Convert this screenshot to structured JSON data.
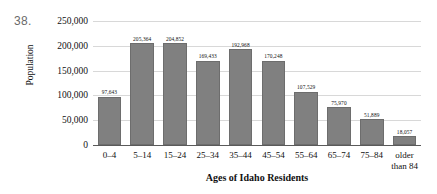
{
  "question_number": "38.",
  "chart_data": {
    "type": "bar",
    "title": "",
    "xlabel": "Ages of Idaho Residents",
    "ylabel": "Population",
    "categories": [
      "0–4",
      "5–14",
      "15–24",
      "25–34",
      "35–44",
      "45–54",
      "55–64",
      "65–74",
      "75–84",
      "older\nthan 84"
    ],
    "values": [
      97643,
      205364,
      204852,
      169433,
      192968,
      170248,
      107529,
      75970,
      51889,
      18057
    ],
    "value_labels": [
      "97,643",
      "205,364",
      "204,852",
      "169,433",
      "192,968",
      "170,248",
      "107,529",
      "75,970",
      "51,889",
      "18,057"
    ],
    "ylim": [
      0,
      250000
    ],
    "yticks": [
      0,
      50000,
      100000,
      150000,
      200000,
      250000
    ],
    "ytick_labels": [
      "0",
      "50,000",
      "100,000",
      "150,000",
      "200,000",
      "250,000"
    ],
    "grid": true,
    "legend": false,
    "bar_color": "#808080",
    "bar_border_color": "#6d6d6d",
    "gridline_color": "#d8d8d8",
    "axis_color": "#5a5a5a"
  }
}
